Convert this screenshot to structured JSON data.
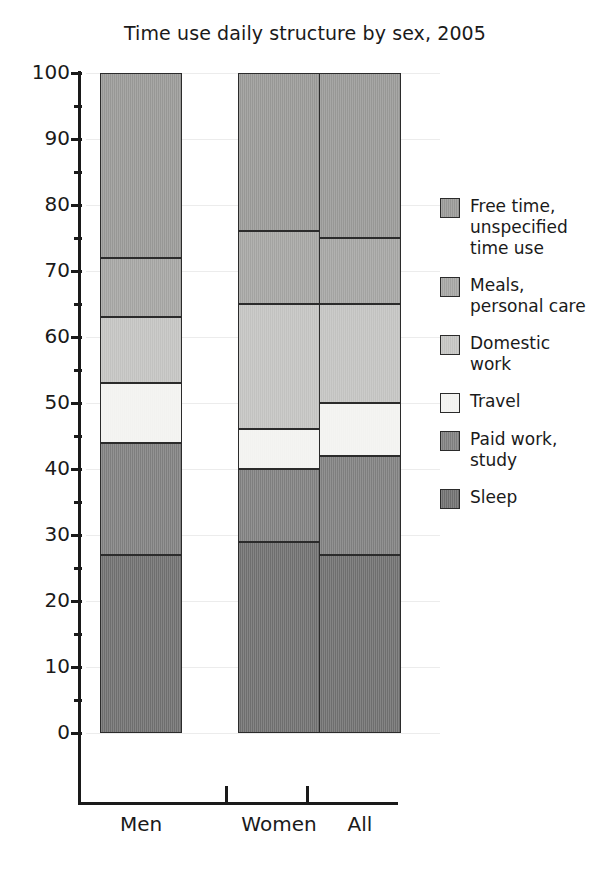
{
  "chart_data": {
    "type": "bar",
    "title": "Time use daily structure by sex, 2005",
    "xlabel": "",
    "ylabel": "",
    "ylim": [
      0,
      100
    ],
    "yticks": [
      0,
      10,
      20,
      30,
      40,
      50,
      60,
      70,
      80,
      90,
      100
    ],
    "grid": true,
    "stacked": true,
    "legend_position": "right",
    "categories": [
      "Men",
      "Women",
      "All"
    ],
    "series": [
      {
        "name": "Sleep",
        "values": [
          27,
          29,
          27
        ],
        "color": "#6e6e6e"
      },
      {
        "name": "Paid work, study",
        "values": [
          17,
          11,
          15
        ],
        "color": "#7e7e7e"
      },
      {
        "name": "Travel",
        "values": [
          9,
          6,
          8
        ],
        "color": "#f2f2f0"
      },
      {
        "name": "Domestic work",
        "values": [
          10,
          19,
          15
        ],
        "color": "#c2c2c0"
      },
      {
        "name": "Meals, personal care",
        "values": [
          9,
          11,
          10
        ],
        "color": "#a3a3a1"
      },
      {
        "name": "Free time, unspecified time use",
        "values": [
          28,
          24,
          25
        ],
        "color": "#979795"
      }
    ]
  },
  "legend": {
    "items": [
      {
        "label": "Free time,\nunspecified\ntime use",
        "color": "#979795"
      },
      {
        "label": "Meals,\npersonal care",
        "color": "#a3a3a1"
      },
      {
        "label": "Domestic\nwork",
        "color": "#c2c2c0"
      },
      {
        "label": "Travel",
        "color": "#f2f2f0"
      },
      {
        "label": "Paid work,\nstudy",
        "color": "#7e7e7e"
      },
      {
        "label": "Sleep",
        "color": "#6e6e6e"
      }
    ]
  },
  "axis": {
    "y_labels": [
      "100",
      "90",
      "80",
      "70",
      "60",
      "50",
      "40",
      "30",
      "20",
      "10",
      "0"
    ],
    "x_labels": [
      "Men",
      "Women",
      "All"
    ]
  }
}
